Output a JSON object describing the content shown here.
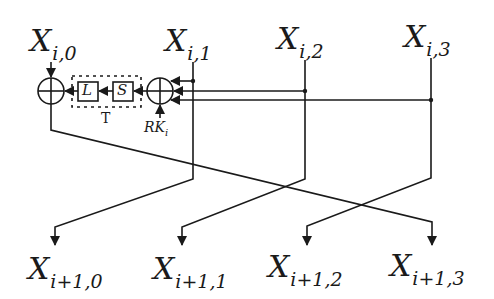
{
  "diagram": {
    "inputs": [
      {
        "var": "X",
        "sub": "i,0"
      },
      {
        "var": "X",
        "sub": "i,1"
      },
      {
        "var": "X",
        "sub": "i,2"
      },
      {
        "var": "X",
        "sub": "i,3"
      }
    ],
    "outputs": [
      {
        "var": "X",
        "sub": "i+1,0"
      },
      {
        "var": "X",
        "sub": "i+1,1"
      },
      {
        "var": "X",
        "sub": "i+1,2"
      },
      {
        "var": "X",
        "sub": "i+1,3"
      }
    ],
    "blocks": {
      "l_label": "L",
      "s_label": "S",
      "t_label": "T",
      "round_key": {
        "var": "RK",
        "sub": "i"
      }
    },
    "colors": {
      "stroke": "#1a1a1a",
      "background": "#ffffff"
    }
  }
}
